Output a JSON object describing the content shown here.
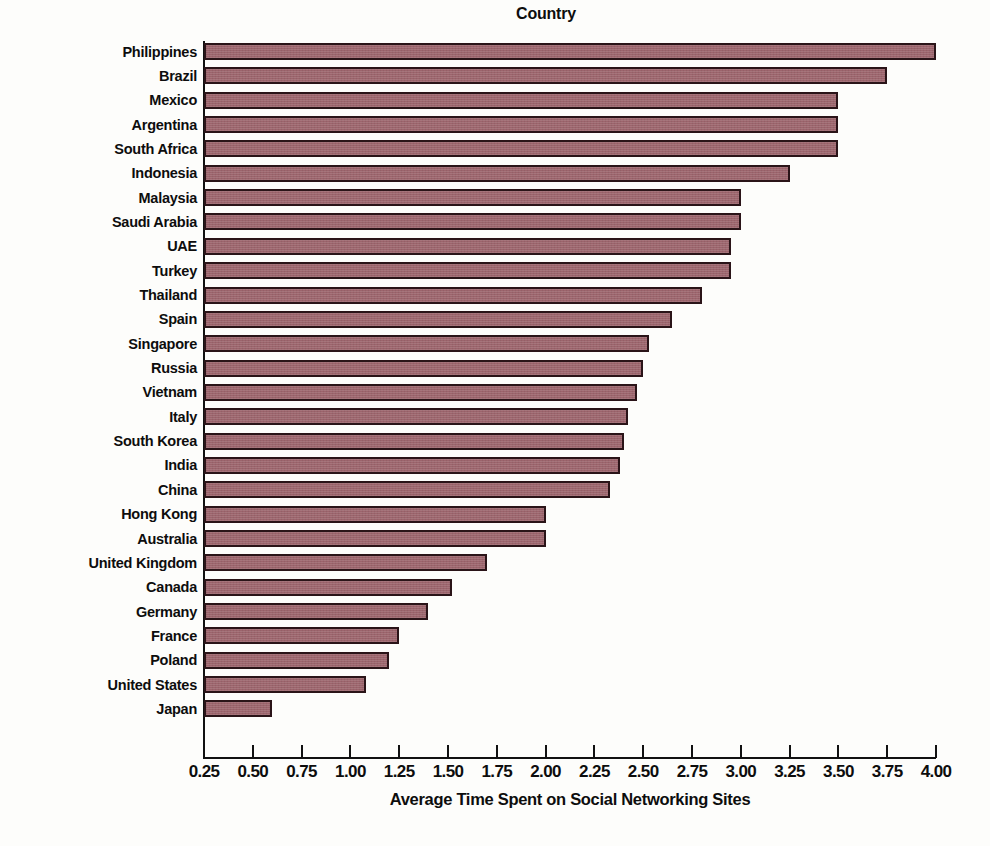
{
  "chart_data": {
    "type": "bar",
    "orientation": "horizontal",
    "title": "Country",
    "xlabel": "Average Time Spent on Social Networking Sites",
    "ylabel": "Country",
    "xlim": [
      0.25,
      4.0
    ],
    "grid": false,
    "legend": null,
    "bar_color": "#9c646c",
    "bar_border_color": "#2a1418",
    "text_color": "#0d0d0d",
    "background_color": "#fdfdfb",
    "xticks": [
      "0.25",
      "0.50",
      "0.75",
      "1.00",
      "1.25",
      "1.50",
      "1.75",
      "2.00",
      "2.25",
      "2.50",
      "2.75",
      "3.00",
      "3.25",
      "3.50",
      "3.75",
      "4.00"
    ],
    "xtick_values": [
      0.25,
      0.5,
      0.75,
      1.0,
      1.25,
      1.5,
      1.75,
      2.0,
      2.25,
      2.5,
      2.75,
      3.0,
      3.25,
      3.5,
      3.75,
      4.0
    ],
    "categories": [
      "Philippines",
      "Brazil",
      "Mexico",
      "Argentina",
      "South Africa",
      "Indonesia",
      "Malaysia",
      "Saudi Arabia",
      "UAE",
      "Turkey",
      "Thailand",
      "Spain",
      "Singapore",
      "Russia",
      "Vietnam",
      "Italy",
      "South Korea",
      "India",
      "China",
      "Hong Kong",
      "Australia",
      "United Kingdom",
      "Canada",
      "Germany",
      "France",
      "Poland",
      "United States",
      "Japan"
    ],
    "values": [
      4.0,
      3.75,
      3.5,
      3.5,
      3.5,
      3.25,
      3.0,
      3.0,
      2.95,
      2.95,
      2.8,
      2.65,
      2.53,
      2.5,
      2.47,
      2.42,
      2.4,
      2.38,
      2.33,
      2.0,
      2.0,
      1.7,
      1.52,
      1.4,
      1.25,
      1.2,
      1.08,
      0.6
    ]
  }
}
